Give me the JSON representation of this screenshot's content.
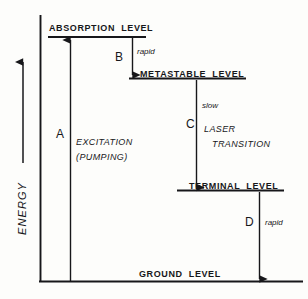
{
  "diagram": {
    "axis": {
      "label": "ENERGY",
      "direction": "up",
      "arrow_icon": "arrow-up-icon"
    },
    "levels": [
      {
        "id": "absorption",
        "label": "ABSORPTION  LEVEL"
      },
      {
        "id": "metastable",
        "label": "METASTABLE  LEVEL"
      },
      {
        "id": "terminal",
        "label": "TERMINAL  LEVEL"
      },
      {
        "id": "ground",
        "label": "GROUND  LEVEL"
      }
    ],
    "transitions": [
      {
        "id": "a",
        "letter": "A",
        "note": "",
        "description_line1": "EXCITATION",
        "description_line2": "(PUMPING)",
        "direction": "up"
      },
      {
        "id": "b",
        "letter": "B",
        "note": "rapid",
        "description_line1": "",
        "description_line2": "",
        "direction": "down"
      },
      {
        "id": "c",
        "letter": "C",
        "note": "slow",
        "description_line1": "LASER",
        "description_line2": "TRANSITION",
        "direction": "down"
      },
      {
        "id": "d",
        "letter": "D",
        "note": "rapid",
        "description_line1": "",
        "description_line2": "",
        "direction": "down"
      }
    ],
    "colors": {
      "ink": "#17171a",
      "background": "#fdfdfb"
    }
  }
}
